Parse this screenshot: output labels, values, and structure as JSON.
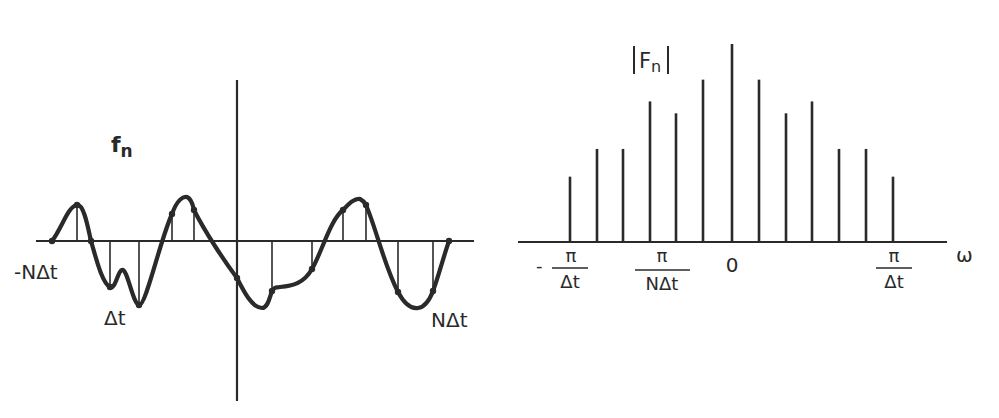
{
  "left_plot": {
    "title": "f",
    "title_sub": "n",
    "label_left": "-NΔt",
    "label_dt": "Δt",
    "label_right": "NΔt",
    "samples": [
      {
        "x": 52,
        "y": 241
      },
      {
        "x": 77,
        "y": 205
      },
      {
        "x": 91,
        "y": 241
      },
      {
        "x": 110,
        "y": 287
      },
      {
        "x": 139,
        "y": 305
      },
      {
        "x": 172,
        "y": 214
      },
      {
        "x": 194,
        "y": 210
      },
      {
        "x": 237,
        "y": 278
      },
      {
        "x": 272,
        "y": 291
      },
      {
        "x": 312,
        "y": 269
      },
      {
        "x": 343,
        "y": 210
      },
      {
        "x": 366,
        "y": 205
      },
      {
        "x": 398,
        "y": 292
      },
      {
        "x": 433,
        "y": 291
      },
      {
        "x": 449,
        "y": 241
      }
    ]
  },
  "right_plot": {
    "title": "F",
    "title_sub": "n",
    "axis_label": "ω",
    "tick_labels": {
      "neg_pi_dt": {
        "sign": "-",
        "num": "π",
        "den": "Δt"
      },
      "pi_ndt": {
        "num": "π",
        "den": "NΔt"
      },
      "zero": "0",
      "pi_dt": {
        "num": "π",
        "den": "Δt"
      }
    }
  },
  "chart_data": {
    "type": "stem",
    "charts": [
      {
        "name": "time-domain samples f_n",
        "xlabel_ticks": [
          "-NΔt",
          "Δt",
          "NΔt"
        ],
        "ylabel": "f_n",
        "note": "continuous curve with sampled stems at uniform spacing Δt",
        "values_relative": [
          0,
          0.9,
          0,
          -1.15,
          -1.6,
          0.68,
          0.78,
          -0.92,
          -1.25,
          -0.7,
          0.78,
          0.9,
          -1.28,
          -1.25,
          0
        ]
      },
      {
        "name": "magnitude spectrum |F_n|",
        "ylabel": "|F_n|",
        "xlabel": "ω",
        "x_ticks": [
          "-π/Δt",
          "π/NΔt",
          "0",
          "π/Δt"
        ],
        "categories": [
          -6,
          -5,
          -4,
          -3,
          -2,
          -1,
          0,
          1,
          2,
          3,
          4,
          5,
          6
        ],
        "values": [
          0.33,
          0.47,
          0.47,
          0.71,
          0.65,
          0.82,
          1.0,
          0.82,
          0.65,
          0.71,
          0.47,
          0.47,
          0.33
        ]
      }
    ]
  }
}
